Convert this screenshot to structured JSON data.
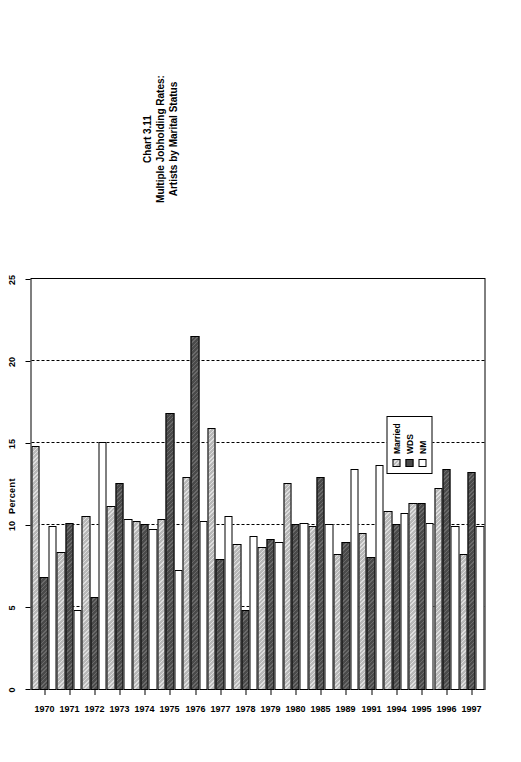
{
  "chart_data": {
    "type": "bar",
    "orientation": "horizontal",
    "title": "Chart 3.11",
    "subtitle_line1": "Multiple Jobholding Rates:",
    "subtitle_line2": "Artists by Marital Status",
    "xlabel": "Percent",
    "ylabel": "",
    "xlim": [
      0,
      25
    ],
    "xticks": [
      0,
      5,
      10,
      15,
      20,
      25
    ],
    "xtick_labels": [
      "0",
      "5",
      "10",
      "15",
      "20",
      "25"
    ],
    "grid": true,
    "grid_style": "dashed",
    "legend_position": "inside-lower-right",
    "categories": [
      "1970",
      "1971",
      "1972",
      "1973",
      "1974",
      "1975",
      "1976",
      "1977",
      "1978",
      "1979",
      "1980",
      "1985",
      "1989",
      "1991",
      "1994",
      "1995",
      "1996",
      "1997"
    ],
    "series": [
      {
        "name": "Married",
        "color": "#b8b8b8",
        "pattern": "hatch",
        "values": [
          14.9,
          8.4,
          10.6,
          11.2,
          10.3,
          10.4,
          13.0,
          16.0,
          8.9,
          8.7,
          12.6,
          10.0,
          8.3,
          9.6,
          10.9,
          11.4,
          12.3,
          8.3
        ]
      },
      {
        "name": "WDS",
        "color": "#4a4a4a",
        "pattern": "hatch",
        "values": [
          6.9,
          10.2,
          5.7,
          12.6,
          10.1,
          16.9,
          21.6,
          8.0,
          4.9,
          9.2,
          10.1,
          13.0,
          9.0,
          8.1,
          10.1,
          11.4,
          13.5,
          13.3
        ]
      },
      {
        "name": "NM",
        "color": "#ffffff",
        "pattern": "solid",
        "values": [
          10.0,
          4.9,
          15.1,
          10.4,
          9.8,
          7.3,
          10.3,
          10.6,
          9.4,
          9.0,
          10.2,
          10.1,
          13.5,
          13.7,
          10.8,
          10.2,
          10.0,
          10.0
        ]
      }
    ]
  },
  "legend": {
    "items": [
      {
        "label": "Married",
        "key": "married"
      },
      {
        "label": "WDS",
        "key": "wds"
      },
      {
        "label": "NM",
        "key": "nm"
      }
    ]
  }
}
